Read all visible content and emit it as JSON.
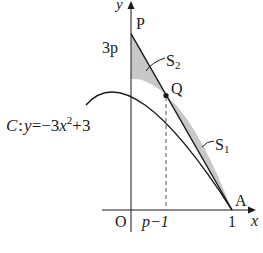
{
  "figure": {
    "type": "function-graph",
    "curve_equation_label": {
      "name": "C",
      "colon": ":",
      "lhs": "y",
      "eq": "=",
      "rhs_prefix": "−3",
      "rhs_var": "x",
      "rhs_exp": "2",
      "rhs_suffix": "+3"
    },
    "axes": {
      "x_label": "x",
      "y_label": "y",
      "origin_label": "O"
    },
    "tick_labels": {
      "x_p_minus_1": "p−1",
      "x_one": "1",
      "y_three_p": "3p"
    },
    "points": {
      "P": "P",
      "Q": "Q",
      "A": "A"
    },
    "regions": {
      "S1": {
        "letter": "S",
        "sub": "1"
      },
      "S2": {
        "letter": "S",
        "sub": "2"
      }
    },
    "colors": {
      "stroke": "#1a1a1a",
      "fill": "#c8c8c8",
      "background": "#ffffff"
    }
  }
}
